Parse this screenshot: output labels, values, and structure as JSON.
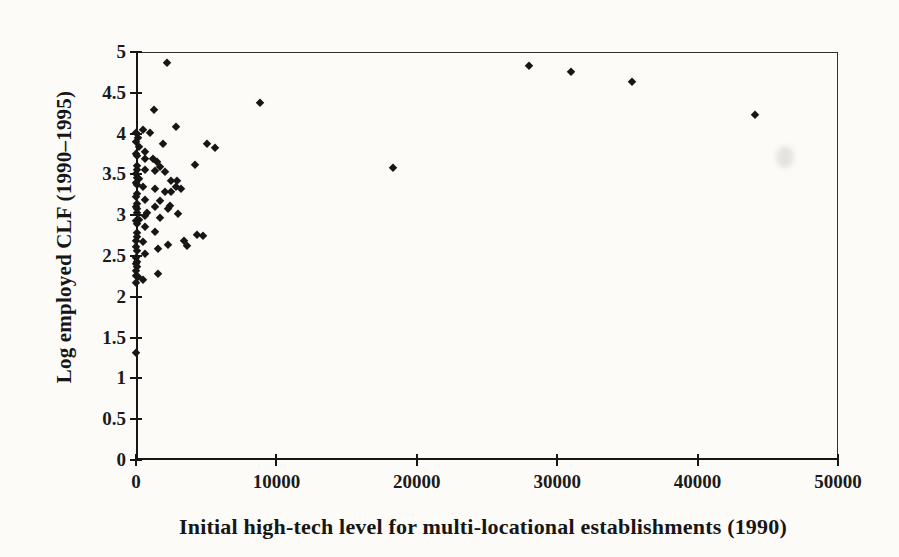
{
  "figure": {
    "background_color": "#fcfbf8",
    "ink_color": "#161616"
  },
  "chart_data": {
    "type": "scatter",
    "title": "",
    "xlabel": "Initial high-tech level for multi-locational establishments (1990)",
    "ylabel": "Log employed CLF (1990–1995)",
    "xlim": [
      0,
      50000
    ],
    "ylim": [
      0,
      5
    ],
    "x_ticks": [
      0,
      10000,
      20000,
      30000,
      40000,
      50000
    ],
    "x_tick_labels": [
      "0",
      "10000",
      "20000",
      "30000",
      "40000",
      "50000"
    ],
    "y_ticks": [
      0,
      0.5,
      1,
      1.5,
      2,
      2.5,
      3,
      3.5,
      4,
      4.5,
      5
    ],
    "y_tick_labels": [
      "0",
      "0.5",
      "1",
      "1.5",
      "2",
      "2.5",
      "3",
      "3.5",
      "4",
      "4.5",
      "5"
    ],
    "grid": false,
    "legend": null,
    "marker": "diamond",
    "marker_color": "#161616",
    "points": [
      [
        2200,
        4.87
      ],
      [
        28000,
        4.83
      ],
      [
        31000,
        4.76
      ],
      [
        35300,
        4.63
      ],
      [
        44100,
        4.23
      ],
      [
        8800,
        4.38
      ],
      [
        18300,
        3.58
      ],
      [
        1300,
        4.29
      ],
      [
        0,
        1.31
      ],
      [
        2850,
        4.08
      ],
      [
        500,
        4.05
      ],
      [
        0,
        4.01
      ],
      [
        1000,
        4.01
      ],
      [
        150,
        3.95
      ],
      [
        0,
        3.9
      ],
      [
        1920,
        3.87
      ],
      [
        5060,
        3.87
      ],
      [
        210,
        3.83
      ],
      [
        5630,
        3.82
      ],
      [
        640,
        3.78
      ],
      [
        0,
        3.75
      ],
      [
        70,
        3.72
      ],
      [
        1210,
        3.69
      ],
      [
        640,
        3.69
      ],
      [
        1500,
        3.65
      ],
      [
        4200,
        3.62
      ],
      [
        70,
        3.6
      ],
      [
        1710,
        3.59
      ],
      [
        640,
        3.56
      ],
      [
        100,
        3.55
      ],
      [
        1350,
        3.54
      ],
      [
        2060,
        3.53
      ],
      [
        0,
        3.5
      ],
      [
        70,
        3.46
      ],
      [
        200,
        3.44
      ],
      [
        2490,
        3.42
      ],
      [
        2920,
        3.42
      ],
      [
        0,
        3.4
      ],
      [
        100,
        3.37
      ],
      [
        500,
        3.35
      ],
      [
        2850,
        3.35
      ],
      [
        1350,
        3.32
      ],
      [
        3200,
        3.32
      ],
      [
        2060,
        3.28
      ],
      [
        2490,
        3.28
      ],
      [
        70,
        3.26
      ],
      [
        0,
        3.22
      ],
      [
        640,
        3.19
      ],
      [
        1710,
        3.17
      ],
      [
        100,
        3.14
      ],
      [
        2420,
        3.11
      ],
      [
        0,
        3.1
      ],
      [
        70,
        3.07
      ],
      [
        780,
        3.03
      ],
      [
        1350,
        3.1
      ],
      [
        2280,
        3.07
      ],
      [
        2990,
        3.01
      ],
      [
        70,
        3.03
      ],
      [
        640,
        2.99
      ],
      [
        1710,
        2.97
      ],
      [
        200,
        2.94
      ],
      [
        0,
        2.93
      ],
      [
        70,
        2.89
      ],
      [
        640,
        2.85
      ],
      [
        1350,
        2.8
      ],
      [
        100,
        2.78
      ],
      [
        4340,
        2.76
      ],
      [
        4770,
        2.74
      ],
      [
        70,
        2.73
      ],
      [
        3400,
        2.68
      ],
      [
        0,
        2.68
      ],
      [
        500,
        2.67
      ],
      [
        2280,
        2.64
      ],
      [
        3630,
        2.62
      ],
      [
        0,
        2.61
      ],
      [
        1570,
        2.58
      ],
      [
        70,
        2.56
      ],
      [
        640,
        2.52
      ],
      [
        0,
        2.47
      ],
      [
        100,
        2.43
      ],
      [
        0,
        2.4
      ],
      [
        70,
        2.37
      ],
      [
        0,
        2.32
      ],
      [
        1600,
        2.28
      ],
      [
        0,
        2.26
      ],
      [
        140,
        2.24
      ],
      [
        500,
        2.21
      ],
      [
        0,
        2.17
      ]
    ]
  }
}
